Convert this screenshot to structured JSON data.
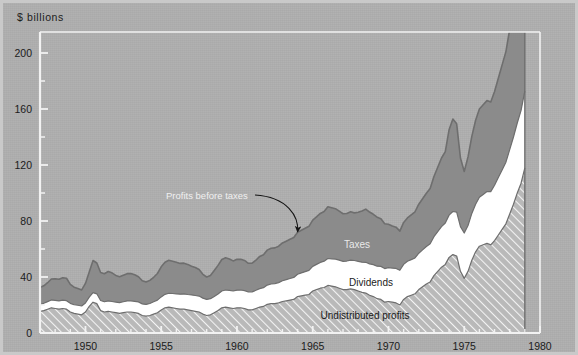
{
  "figure": {
    "unit_label": "$ billions",
    "background_color": "#aeaeae",
    "frame_color": "#f2f2f2",
    "border_color": "#c9c9c9"
  },
  "annotations": {
    "callout": "Profits before taxes",
    "taxes": "Taxes",
    "dividends": "Dividends",
    "undistributed": "Undistributed profits"
  },
  "chart_data": {
    "type": "area",
    "title": "",
    "subtitle": "",
    "xlabel": "",
    "ylabel": "$ billions",
    "ylim": [
      0,
      215
    ],
    "xlim": [
      1947,
      1980
    ],
    "grid": false,
    "legend": "in-plot labels",
    "stacked": true,
    "y_ticks_major": [
      0,
      40,
      80,
      120,
      160,
      200
    ],
    "y_ticks_minor": [
      20,
      60,
      100,
      140,
      180
    ],
    "x_ticks_major": [
      1950,
      1955,
      1960,
      1965,
      1970,
      1975,
      1980
    ],
    "x_tick_minor_step": 1,
    "annotation_arrow": {
      "text": "Profits before taxes",
      "points_to_x": 1964.0,
      "points_to_y": 68
    },
    "series_colors": {
      "undistributed_profits": "#b8b8b8",
      "dividends": "#ffffff",
      "taxes": "#8b8b8b",
      "outline": "#6e6e6e"
    },
    "x": [
      1947.0,
      1947.25,
      1947.5,
      1947.75,
      1948.0,
      1948.25,
      1948.5,
      1948.75,
      1949.0,
      1949.25,
      1949.5,
      1949.75,
      1950.0,
      1950.25,
      1950.5,
      1950.75,
      1951.0,
      1951.25,
      1951.5,
      1951.75,
      1952.0,
      1952.25,
      1952.5,
      1952.75,
      1953.0,
      1953.25,
      1953.5,
      1953.75,
      1954.0,
      1954.25,
      1954.5,
      1954.75,
      1955.0,
      1955.25,
      1955.5,
      1955.75,
      1956.0,
      1956.25,
      1956.5,
      1956.75,
      1957.0,
      1957.25,
      1957.5,
      1957.75,
      1958.0,
      1958.25,
      1958.5,
      1958.75,
      1959.0,
      1959.25,
      1959.5,
      1959.75,
      1960.0,
      1960.25,
      1960.5,
      1960.75,
      1961.0,
      1961.25,
      1961.5,
      1961.75,
      1962.0,
      1962.25,
      1962.5,
      1962.75,
      1963.0,
      1963.25,
      1963.5,
      1963.75,
      1964.0,
      1964.25,
      1964.5,
      1964.75,
      1965.0,
      1965.25,
      1965.5,
      1965.75,
      1966.0,
      1966.25,
      1966.5,
      1966.75,
      1967.0,
      1967.25,
      1967.5,
      1967.75,
      1968.0,
      1968.25,
      1968.5,
      1968.75,
      1969.0,
      1969.25,
      1969.5,
      1969.75,
      1970.0,
      1970.25,
      1970.5,
      1970.75,
      1971.0,
      1971.25,
      1971.5,
      1971.75,
      1972.0,
      1972.25,
      1972.5,
      1972.75,
      1973.0,
      1973.25,
      1973.5,
      1973.75,
      1974.0,
      1974.25,
      1974.5,
      1974.75,
      1975.0,
      1975.25,
      1975.5,
      1975.75,
      1976.0,
      1976.25,
      1976.5,
      1976.75,
      1977.0,
      1977.25,
      1977.5,
      1977.75,
      1978.0,
      1978.25,
      1978.5,
      1978.75,
      1979.0
    ],
    "series": [
      {
        "name": "Undistributed profits",
        "pattern": "diagonal-hatch",
        "values": [
          15.5,
          16.0,
          17.0,
          18.0,
          17.5,
          17.0,
          17.5,
          17.0,
          15.0,
          14.0,
          13.5,
          13.0,
          15.0,
          19.0,
          22.0,
          21.0,
          16.0,
          15.0,
          15.5,
          15.0,
          14.5,
          14.0,
          14.5,
          15.0,
          15.0,
          14.5,
          14.0,
          12.5,
          12.0,
          12.5,
          13.5,
          14.5,
          16.5,
          18.0,
          18.5,
          18.0,
          17.5,
          17.0,
          17.0,
          16.5,
          16.0,
          15.5,
          15.0,
          13.5,
          12.5,
          13.0,
          14.5,
          16.0,
          18.0,
          18.5,
          18.0,
          17.5,
          18.0,
          18.0,
          17.5,
          16.5,
          16.5,
          17.5,
          18.5,
          19.0,
          20.5,
          21.0,
          21.0,
          21.5,
          22.5,
          23.0,
          23.5,
          24.0,
          26.0,
          26.5,
          27.0,
          27.5,
          30.0,
          31.0,
          32.0,
          32.5,
          34.0,
          33.5,
          33.0,
          32.0,
          31.0,
          31.0,
          31.5,
          31.0,
          30.0,
          29.0,
          28.5,
          27.0,
          26.0,
          24.5,
          24.0,
          22.0,
          22.5,
          22.0,
          21.5,
          20.0,
          24.0,
          26.0,
          27.0,
          28.0,
          31.0,
          33.0,
          35.0,
          36.5,
          41.0,
          44.0,
          47.0,
          49.0,
          54.0,
          56.0,
          55.0,
          44.0,
          39.0,
          44.0,
          52.0,
          58.0,
          62.0,
          63.0,
          64.0,
          63.0,
          66.0,
          70.0,
          74.0,
          78.0,
          85.0,
          92.0,
          100.0,
          107.0,
          118.0
        ]
      },
      {
        "name": "Dividends",
        "pattern": "solid-white",
        "values": [
          5.0,
          5.2,
          5.4,
          5.6,
          5.8,
          5.9,
          6.0,
          6.1,
          6.2,
          6.2,
          6.3,
          6.3,
          6.4,
          6.6,
          6.8,
          7.0,
          7.2,
          7.3,
          7.4,
          7.5,
          7.6,
          7.7,
          7.8,
          7.9,
          8.0,
          8.1,
          8.2,
          8.3,
          8.4,
          8.6,
          8.8,
          9.0,
          9.3,
          9.6,
          9.9,
          10.2,
          10.5,
          10.7,
          10.9,
          11.0,
          11.2,
          11.3,
          11.4,
          11.4,
          11.5,
          11.5,
          11.6,
          11.8,
          12.0,
          12.2,
          12.4,
          12.5,
          12.6,
          12.7,
          12.8,
          12.8,
          12.9,
          13.0,
          13.2,
          13.4,
          13.7,
          14.0,
          14.3,
          14.5,
          14.8,
          15.1,
          15.4,
          15.7,
          16.0,
          16.4,
          16.8,
          17.2,
          17.6,
          18.0,
          18.4,
          18.8,
          19.2,
          19.5,
          19.8,
          20.0,
          20.2,
          20.4,
          20.6,
          20.8,
          21.2,
          21.6,
          22.0,
          22.4,
          22.8,
          23.2,
          23.6,
          24.0,
          24.2,
          24.4,
          24.6,
          24.8,
          25.0,
          25.2,
          25.4,
          25.6,
          26.0,
          26.4,
          26.8,
          27.2,
          27.8,
          28.4,
          29.0,
          29.6,
          30.2,
          30.8,
          31.4,
          32.0,
          32.4,
          32.8,
          33.4,
          34.0,
          35.0,
          36.0,
          37.0,
          38.0,
          39.5,
          41.0,
          42.5,
          44.0,
          46.0,
          48.0,
          50.0,
          52.0,
          55.0
        ]
      },
      {
        "name": "Taxes",
        "pattern": "solid-gray",
        "values": [
          12.0,
          12.5,
          13.5,
          15.0,
          15.5,
          15.5,
          16.0,
          16.0,
          13.5,
          12.5,
          12.0,
          11.5,
          14.0,
          18.0,
          23.0,
          22.0,
          20.0,
          20.0,
          21.0,
          20.5,
          19.0,
          18.5,
          19.0,
          19.5,
          19.5,
          19.0,
          18.0,
          16.5,
          16.0,
          16.5,
          17.5,
          19.0,
          21.5,
          23.0,
          23.5,
          23.0,
          22.5,
          22.0,
          22.0,
          21.5,
          20.5,
          20.0,
          19.0,
          17.0,
          16.0,
          16.5,
          18.5,
          20.5,
          22.5,
          23.0,
          22.5,
          21.5,
          22.0,
          22.0,
          21.5,
          20.5,
          20.5,
          21.5,
          23.0,
          23.5,
          25.0,
          25.5,
          25.5,
          26.0,
          27.0,
          27.5,
          28.0,
          28.5,
          30.0,
          30.5,
          31.0,
          31.5,
          33.0,
          34.0,
          35.0,
          35.5,
          37.0,
          36.5,
          36.0,
          35.0,
          34.0,
          34.0,
          34.5,
          34.0,
          35.0,
          36.5,
          38.0,
          37.0,
          36.0,
          35.0,
          34.0,
          32.0,
          31.0,
          30.0,
          29.5,
          28.0,
          30.0,
          31.0,
          32.0,
          33.0,
          35.0,
          36.5,
          38.0,
          39.5,
          43.0,
          46.0,
          49.0,
          51.0,
          61.0,
          66.0,
          63.0,
          49.0,
          44.0,
          49.0,
          55.0,
          60.0,
          63.0,
          64.0,
          65.0,
          64.0,
          67.0,
          71.0,
          75.0,
          79.0,
          86.0,
          93.0,
          100.0,
          98.0,
          95.0
        ]
      }
    ]
  }
}
